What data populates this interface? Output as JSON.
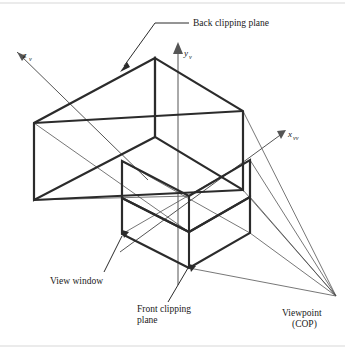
{
  "figure": {
    "background_color": "#ffffff",
    "width": 345,
    "height": 349,
    "edge_color": "#2b2b2b",
    "thin_line_color": "#4a4a4a",
    "axis_color": "#555555",
    "frame_color": "#d8d8d8"
  },
  "axes": [
    {
      "id": "z-axis",
      "symbol": "z",
      "subscript": "v",
      "label": "z",
      "label_x": 23,
      "label_y": 58,
      "sub_x": 29,
      "sub_y": 60.5,
      "line": "M 148,180 L 17,52",
      "arrow_points": "17,52 26,56 22,61"
    },
    {
      "id": "y-axis",
      "symbol": "y",
      "subscript": "v",
      "label": "y",
      "label_x": 184,
      "label_y": 56,
      "sub_x": 189,
      "sub_y": 58.5,
      "line": "M 178,285 L 178,48",
      "arrow_points": "178,42 183,54 173,54"
    },
    {
      "id": "x-axis",
      "symbol": "x",
      "subscript": "vv",
      "label": "x",
      "label_x": 288,
      "label_y": 137,
      "sub_x": 293,
      "sub_y": 139.5,
      "line": "M 120,252 L 283,133",
      "arrow_points": "286,130 277,131 281,139"
    }
  ],
  "labels": [
    {
      "id": "back-clipping-plane",
      "lines": [
        "Back clipping plane"
      ],
      "x": 193,
      "y": 26,
      "anchor": "start",
      "leader": "M 189,23 L 155,23 L 124,66",
      "arrow_points": "120,72 130,67 127,62"
    },
    {
      "id": "view-window",
      "lines": [
        "View window"
      ],
      "x": 50,
      "y": 284,
      "anchor": "start",
      "leader": "M 104,272 L 122,236",
      "arrow_points": null
    },
    {
      "id": "front-clipping-plane",
      "lines": [
        "Front clipping",
        "plane"
      ],
      "x": 137,
      "y": 312,
      "anchor": "start",
      "leader": "M 168,302 L 188,268",
      "arrow_points": null
    },
    {
      "id": "viewpoint-cop",
      "lines": [
        "Viewpoint",
        "(COP)"
      ],
      "x": 282,
      "y": 316,
      "anchor": "start",
      "leader": null,
      "arrow_points": null
    }
  ],
  "geometry": {
    "viewpoint": {
      "x": 336,
      "y": 296
    },
    "back_plane": {
      "name": "back-clipping-plane-quad",
      "path": "M 155,58 L 34,123 L 34,200 L 155,137 Z"
    },
    "back_plane_right": {
      "name": "back-plane-right-face",
      "path": "M 155,58 L 155,137 L 243,190 L 243,111 Z"
    },
    "back_top_edge": {
      "name": "back-top-edge",
      "path": "M 155,58 L 243,111"
    },
    "back_bottom_edge": {
      "name": "back-bottom-edge",
      "path": "M 155,137 L 243,190"
    },
    "frustum_upper_edges": {
      "name": "frustum-side-edges",
      "path": "M 34,123 L 243,111 M 34,200 L 243,190"
    },
    "front_plane": {
      "name": "front-clipping-plane-quad",
      "path": "M 122,234 L 189,268 L 250,233 L 250,197 L 189,232 L 122,198 Z"
    },
    "view_window_quad": {
      "name": "view-window-quad",
      "path": "M 122,198 L 189,232 L 250,197 L 250,160 L 189,196 L 122,161 Z"
    },
    "vertical_edges": {
      "name": "vertical-edges",
      "path": "M 122,198 L 122,234 M 189,232 L 189,268 M 250,160 L 250,233 M 155,58 L 155,137 M 34,123 L 34,200 M 243,111 L 243,190"
    },
    "inner_struts": {
      "name": "inner-struts",
      "path": "M 122,161 L 122,198 M 189,196 L 189,232"
    },
    "projection_rays": {
      "name": "projection-rays-to-viewpoint",
      "paths": [
        "M 250,160 L 336,296",
        "M 250,197 L 336,296",
        "M 250,233 L 336,296",
        "M 189,268 L 336,296",
        "M 243,111 L 336,296",
        "M 243,190 L 336,296"
      ]
    },
    "interior_diagonals": {
      "name": "interior-diagonals",
      "path": "M 34,123 L 189,232 M 34,200 L 189,196 M 122,161 L 250,233 M 122,234 L 250,160"
    },
    "corner_markers": [
      {
        "id": "view-window-corner-marker",
        "points": "122,230 129,232 124,238"
      },
      {
        "id": "front-plane-corner-marker",
        "points": "189,264 196,266 191,272"
      }
    ]
  },
  "frame": {
    "top_rule": "M 0,3 L 345,3",
    "bottom_rule": "M 0,346 L 345,346"
  }
}
